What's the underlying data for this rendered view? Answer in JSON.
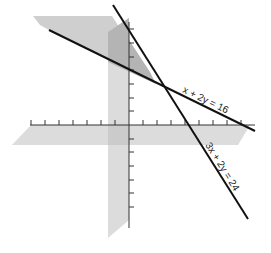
{
  "diagram": {
    "type": "linear-inequalities-graph",
    "axes": {
      "x_axis": {
        "tick_count_left": 7,
        "tick_count_right": 8
      },
      "y_axis": {
        "tick_count_up": 7,
        "tick_count_down": 6
      }
    },
    "lines": [
      {
        "id": "line1",
        "label": "x + 2y = 16"
      },
      {
        "id": "line2",
        "label": "3x + 2y = 24"
      }
    ],
    "regions": [
      {
        "id": "band-vertical",
        "description": "half-plane x ≤ 0 shading (light gray band along y-axis)"
      },
      {
        "id": "band-horizontal",
        "description": "half-plane y ≤ 0 shading (light gray band along x-axis)"
      },
      {
        "id": "region-above-lines",
        "description": "shaded region above x + 2y = 16 and left of 3x + 2y = 24"
      }
    ],
    "colors": {
      "band": "#d9d9d9",
      "band_dark": "#bdbdbd",
      "overlap": "#aaaaaa",
      "line": "#111111",
      "axis": "#333333"
    }
  }
}
